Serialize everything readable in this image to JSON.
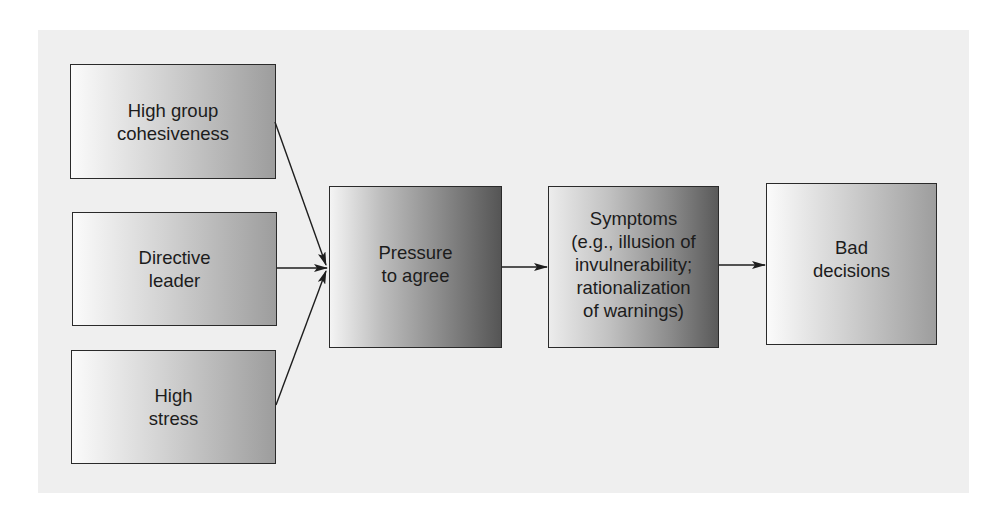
{
  "diagram": {
    "type": "flowchart",
    "title": "",
    "nodes": [
      {
        "id": "cohesiveness",
        "label": "High group\ncohesiveness"
      },
      {
        "id": "leader",
        "label": "Directive\nleader"
      },
      {
        "id": "stress",
        "label": "High\nstress"
      },
      {
        "id": "pressure",
        "label": "Pressure\nto agree"
      },
      {
        "id": "symptoms",
        "label": "Symptoms\n(e.g., illusion of\ninvulnerability;\nrationalization\nof warnings)"
      },
      {
        "id": "bad",
        "label": "Bad\ndecisions"
      }
    ],
    "edges": [
      {
        "from": "cohesiveness",
        "to": "pressure"
      },
      {
        "from": "leader",
        "to": "pressure"
      },
      {
        "from": "stress",
        "to": "pressure"
      },
      {
        "from": "pressure",
        "to": "symptoms"
      },
      {
        "from": "symptoms",
        "to": "bad"
      }
    ]
  },
  "colors": {
    "panel_background": "#efefef",
    "box_border": "#2a2a2a",
    "arrow": "#1e1e1e"
  }
}
